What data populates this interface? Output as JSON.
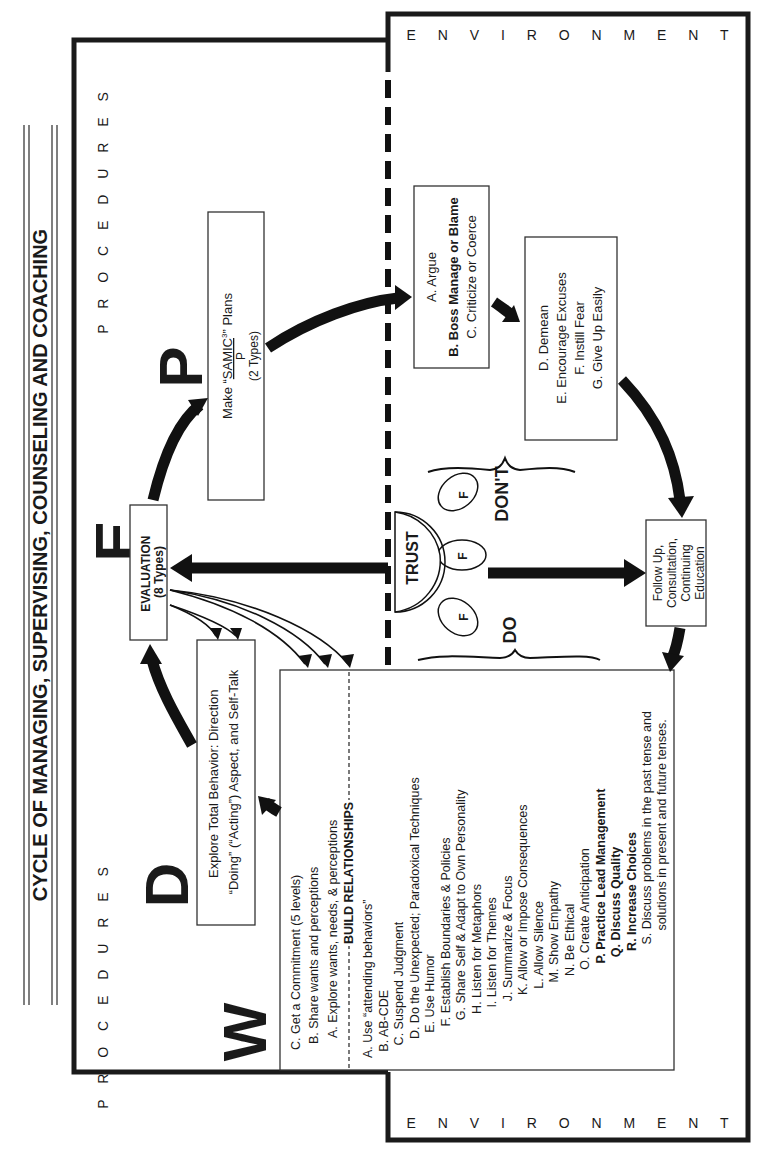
{
  "title": "CYCLE OF MANAGING, SUPERVISING, COUNSELING AND COACHING",
  "labels": {
    "procedures": "P R O C E D U R E S",
    "environment": "E N V I R O N M E N T",
    "W": "W",
    "D": "D",
    "E": "E",
    "P": "P",
    "trust": "TRUST",
    "f": "F",
    "do": "DO",
    "dont": "DON'T"
  },
  "boxes": {
    "explore": [
      "Explore Total Behavior: Direction",
      "“Doing” (“Acting”) Aspect, and Self-Talk"
    ],
    "evaluation": [
      "EVALUATION",
      "(8 Types)"
    ],
    "plans": {
      "prefix": "Make “",
      "samic": "SAMIC",
      "sup": "3",
      "suffix": "” Plans",
      "denominator": "P",
      "types": "(2 Types)"
    },
    "dont_group1": [
      "A. Argue",
      "B. Boss Manage or Blame",
      "C. Criticize or Coerce"
    ],
    "dont_group2": [
      "D. Demean",
      "E. Encourage Excuses",
      "F. Instill Fear",
      "G. Give Up Easily"
    ],
    "follow_up": [
      "Follow Up,",
      "Consultation,",
      "Continuing",
      "Education"
    ]
  },
  "wdep_list": [
    "C. Get a Commitment (5 levels)",
    "B. Share wants and perceptions",
    "A. Explore wants, needs, & perceptions"
  ],
  "build_relationships": {
    "heading": "BUILD RELATIONSHIPS",
    "items": [
      {
        "text": "A. Use “attending behaviors”",
        "bold": false
      },
      {
        "text": "B. AB-CDE",
        "bold": false
      },
      {
        "text": "C. Suspend Judgment",
        "bold": false
      },
      {
        "text": "D. Do the Unexpected; Paradoxical Techniques",
        "bold": false
      },
      {
        "text": "E. Use Humor",
        "bold": false
      },
      {
        "text": "F. Establish Boundaries & Policies",
        "bold": false
      },
      {
        "text": "G. Share Self & Adapt to Own Personality",
        "bold": false
      },
      {
        "text": "H. Listen for Metaphors",
        "bold": false
      },
      {
        "text": "I. Listen for Themes",
        "bold": false
      },
      {
        "text": "J. Summarize & Focus",
        "bold": false
      },
      {
        "text": "K. Allow or Impose Consequences",
        "bold": false
      },
      {
        "text": "L. Allow Silence",
        "bold": false
      },
      {
        "text": "M. Show Empathy",
        "bold": false
      },
      {
        "text": "N. Be Ethical",
        "bold": false
      },
      {
        "text": "O. Create Anticipation",
        "bold": false
      },
      {
        "text": "P. Practice Lead Management",
        "bold": true
      },
      {
        "text": "Q. Discuss Quality",
        "bold": true
      },
      {
        "text": "R. Increase Choices",
        "bold": true
      },
      {
        "text": "S. Discuss problems in the past tense and",
        "bold": false
      },
      {
        "text": "solutions in present and future tenses.",
        "bold": false
      }
    ]
  }
}
